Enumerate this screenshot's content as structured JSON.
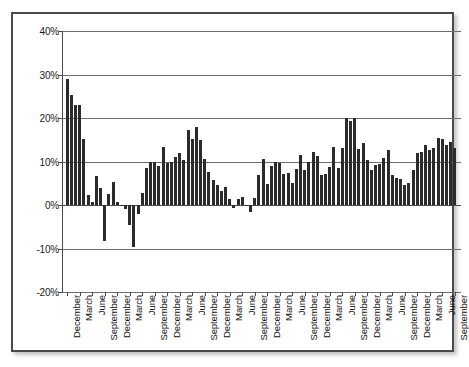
{
  "chart_data": {
    "type": "bar",
    "title": "",
    "subtitle": "",
    "xlabel": "",
    "ylabel": "",
    "ylim": [
      -20,
      40
    ],
    "ytick_values": [
      40,
      30,
      20,
      10,
      0,
      -10,
      -20
    ],
    "ytick_labels": [
      "40%",
      "30%",
      "20%",
      "10%",
      "0%",
      "-10%",
      "-20%"
    ],
    "grid": true,
    "legend": null,
    "bar_color": "#2b2b2b",
    "x_label_interval": 3,
    "x_tick_labels": [
      "December",
      "March",
      "June",
      "September",
      "December",
      "March",
      "June",
      "September",
      "December",
      "March",
      "June",
      "September",
      "December",
      "March",
      "June",
      "September",
      "December",
      "March",
      "June",
      "September",
      "December",
      "March",
      "June",
      "September",
      "December",
      "March",
      "June",
      "September",
      "December",
      "March",
      "June",
      "September",
      "December",
      "March",
      "June",
      "September",
      "December",
      "March",
      "June",
      "September",
      "December"
    ],
    "values": [
      29.0,
      25.4,
      23.0,
      23.0,
      15.2,
      2.4,
      0.8,
      6.7,
      3.9,
      -8.2,
      2.6,
      5.2,
      0.7,
      -0.3,
      -0.9,
      -4.6,
      -9.7,
      -2.0,
      2.8,
      8.6,
      9.9,
      9.8,
      8.9,
      13.3,
      9.6,
      9.8,
      11.1,
      12.0,
      10.3,
      17.3,
      15.2,
      18.0,
      14.9,
      10.6,
      7.5,
      5.8,
      4.7,
      3.3,
      4.1,
      1.4,
      -0.6,
      1.3,
      1.8,
      0.1,
      -1.5,
      1.7,
      6.9,
      10.5,
      4.8,
      8.9,
      9.9,
      9.7,
      7.2,
      7.4,
      5.0,
      8.2,
      11.6,
      8.1,
      10.0,
      12.2,
      11.2,
      6.9,
      7.2,
      8.8,
      13.3,
      8.4,
      13.1,
      19.9,
      19.4,
      19.9,
      12.8,
      14.2,
      10.4,
      8.0,
      9.3,
      9.5,
      10.8,
      12.6,
      7.0,
      6.1,
      5.9,
      4.7,
      5.0,
      8.0,
      11.9,
      12.1,
      13.9,
      12.6,
      13.2,
      15.4,
      15.1,
      13.7,
      14.4,
      13.1
    ]
  }
}
